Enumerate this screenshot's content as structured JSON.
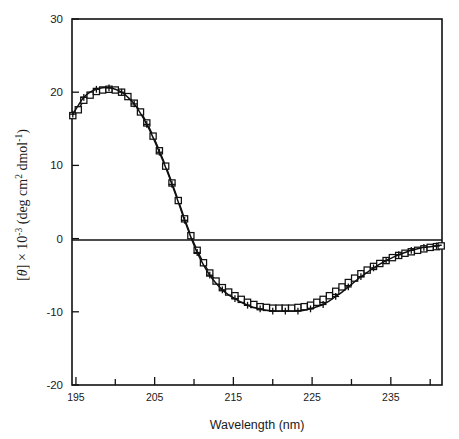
{
  "figure": {
    "name": "cd-spectrum-figure",
    "background": "#ffffff",
    "ink_color": "#101010"
  },
  "chart_data": {
    "type": "line",
    "title": "",
    "subtitle": "",
    "xlabel": "Wavelength (nm)",
    "ylabel_parts": {
      "theta_open": "[",
      "theta": "θ",
      "theta_close": "]",
      "times": " × 10",
      "exp": "-3",
      "units_open": " (deg cm",
      "units_sq": "2",
      "units_mid": " dmol",
      "units_exp": "-1",
      "units_close": ")"
    },
    "ylabel": "[θ] × 10-3 (deg cm2 dmol-1)",
    "xlim": [
      194.5,
      241.5
    ],
    "ylim": [
      -20,
      30
    ],
    "xticks": [
      195,
      205,
      215,
      225,
      235
    ],
    "xtick_labels": [
      "195",
      "205",
      "215",
      "225",
      "235"
    ],
    "xminor_ticks": [
      200,
      210,
      220,
      230,
      240
    ],
    "yticks": [
      30,
      20,
      10,
      0,
      -10,
      -20
    ],
    "ytick_labels": [
      "30",
      "20",
      "10",
      "0",
      "-10",
      "-20"
    ],
    "grid": false,
    "legend": "none",
    "zero_line": true,
    "frame": "box",
    "series": [
      {
        "name": "series-squares",
        "marker": "open-square",
        "line": "solid",
        "x": [
          194.6,
          195.3,
          196.0,
          196.8,
          197.6,
          198.4,
          199.2,
          200.0,
          200.8,
          201.6,
          202.4,
          203.2,
          204.0,
          204.8,
          205.6,
          206.4,
          207.2,
          208.0,
          208.8,
          209.6,
          210.4,
          211.2,
          212.0,
          212.8,
          213.6,
          214.4,
          215.2,
          216.0,
          216.8,
          217.6,
          218.4,
          219.2,
          220.0,
          220.8,
          221.6,
          222.4,
          223.2,
          224.0,
          224.8,
          225.6,
          226.4,
          227.2,
          228.0,
          228.8,
          229.6,
          230.4,
          231.2,
          232.0,
          232.8,
          233.6,
          234.4,
          235.2,
          236.0,
          236.8,
          237.6,
          238.4,
          239.2,
          240.0,
          240.8,
          241.4
        ],
        "y": [
          16.8,
          17.6,
          18.9,
          19.6,
          20.1,
          20.3,
          20.4,
          20.3,
          20.0,
          19.4,
          18.5,
          17.3,
          15.8,
          14.0,
          12.0,
          9.9,
          7.6,
          5.2,
          2.7,
          0.4,
          -1.6,
          -3.3,
          -4.7,
          -5.8,
          -6.7,
          -7.3,
          -7.8,
          -8.3,
          -8.7,
          -9.0,
          -9.3,
          -9.4,
          -9.5,
          -9.5,
          -9.5,
          -9.5,
          -9.4,
          -9.3,
          -9.1,
          -8.7,
          -8.3,
          -7.8,
          -7.2,
          -6.6,
          -6.0,
          -5.4,
          -4.8,
          -4.3,
          -3.8,
          -3.4,
          -3.0,
          -2.6,
          -2.3,
          -2.0,
          -1.8,
          -1.6,
          -1.4,
          -1.2,
          -1.1,
          -1.0
        ]
      },
      {
        "name": "series-plus",
        "marker": "plus",
        "line": "solid",
        "x": [
          194.6,
          195.3,
          196.0,
          196.8,
          197.6,
          198.4,
          199.2,
          200.0,
          200.8,
          201.6,
          202.4,
          203.2,
          204.0,
          204.8,
          205.6,
          206.4,
          207.2,
          208.0,
          208.8,
          209.6,
          210.4,
          211.2,
          212.0,
          212.8,
          213.6,
          214.4,
          215.2,
          216.0,
          216.8,
          217.6,
          218.4,
          219.2,
          220.0,
          220.8,
          221.6,
          222.4,
          223.2,
          224.0,
          224.8,
          225.6,
          226.4,
          227.2,
          228.0,
          228.8,
          229.6,
          230.4,
          231.2,
          232.0,
          232.8,
          233.6,
          234.4,
          235.2,
          236.0,
          236.8,
          237.6,
          238.4,
          239.2,
          240.0,
          240.8,
          241.4
        ],
        "y": [
          17.0,
          18.2,
          19.3,
          20.0,
          20.4,
          20.6,
          20.6,
          20.4,
          20.0,
          19.3,
          18.4,
          17.1,
          15.6,
          13.8,
          11.8,
          9.7,
          7.4,
          5.0,
          2.5,
          0.2,
          -1.9,
          -3.6,
          -5.0,
          -6.1,
          -7.0,
          -7.7,
          -8.2,
          -8.7,
          -9.1,
          -9.4,
          -9.6,
          -9.8,
          -9.9,
          -9.9,
          -9.9,
          -9.9,
          -9.9,
          -9.8,
          -9.6,
          -9.3,
          -9.0,
          -8.5,
          -7.9,
          -7.3,
          -6.6,
          -5.9,
          -5.2,
          -4.6,
          -4.0,
          -3.5,
          -3.0,
          -2.6,
          -2.2,
          -1.9,
          -1.6,
          -1.4,
          -1.2,
          -1.1,
          -1.0,
          -0.9
        ]
      }
    ]
  },
  "geometry": {
    "plot_left": 72,
    "plot_right": 442,
    "plot_top": 19,
    "plot_bottom": 385
  }
}
